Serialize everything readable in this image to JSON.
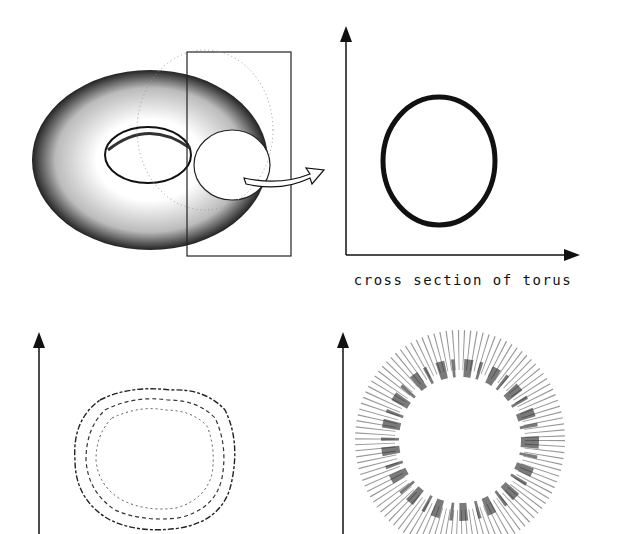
{
  "panels": {
    "torus": {
      "label": "torus with cutting plane",
      "arrow": "to cross section"
    },
    "cross_section": {
      "caption": "cross section of torus",
      "shape": "thin ring"
    },
    "perturbed": {
      "shape": "wavy ring"
    },
    "scattered": {
      "shape": "dispersed ring"
    }
  },
  "colors": {
    "ink": "#111111",
    "background": "#ffffff"
  }
}
